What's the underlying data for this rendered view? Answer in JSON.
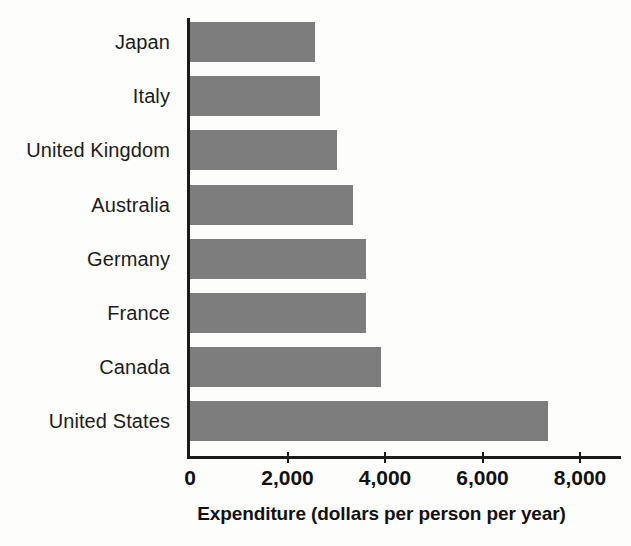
{
  "chart_data": {
    "type": "bar",
    "orientation": "horizontal",
    "title": "",
    "xlabel": "Expenditure (dollars per person per year)",
    "ylabel": "",
    "categories": [
      "Japan",
      "Italy",
      "United Kingdom",
      "Australia",
      "Germany",
      "France",
      "Canada",
      "United States"
    ],
    "values": [
      2560,
      2670,
      3020,
      3340,
      3610,
      3610,
      3920,
      7340
    ],
    "xlim": [
      0,
      8400
    ],
    "xticks": [
      0,
      2000,
      4000,
      6000,
      8000
    ],
    "xticklabels": [
      "0",
      "2,000",
      "4,000",
      "6,000",
      "8,000"
    ],
    "grid": false,
    "legend": false,
    "bar_color": "#7d7d7d",
    "axis_color": "#1a1a1a",
    "background_color": "#fdfdfb"
  },
  "axis": {
    "title": "Expenditure (dollars per person per year)",
    "ticks": [
      {
        "label": "0",
        "value": 0
      },
      {
        "label": "2,000",
        "value": 2000
      },
      {
        "label": "4,000",
        "value": 4000
      },
      {
        "label": "6,000",
        "value": 6000
      },
      {
        "label": "8,000",
        "value": 8000
      }
    ]
  },
  "bars": [
    {
      "label": "Japan",
      "value": 2560
    },
    {
      "label": "Italy",
      "value": 2670
    },
    {
      "label": "United Kingdom",
      "value": 3020
    },
    {
      "label": "Australia",
      "value": 3340
    },
    {
      "label": "Germany",
      "value": 3610
    },
    {
      "label": "France",
      "value": 3610
    },
    {
      "label": "Canada",
      "value": 3920
    },
    {
      "label": "United States",
      "value": 7340
    }
  ]
}
